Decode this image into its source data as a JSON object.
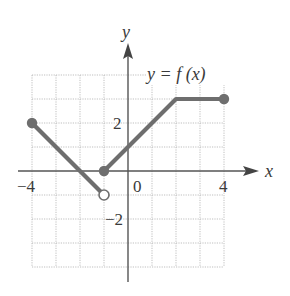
{
  "chart_data": {
    "type": "line",
    "title": "",
    "function_label": "y = f (x)",
    "xlabel": "x",
    "ylabel": "y",
    "xlim": [
      -4,
      4
    ],
    "ylim": [
      -4,
      4
    ],
    "grid": true,
    "x_ticks": [
      {
        "value": -4,
        "label": "−4"
      },
      {
        "value": 0,
        "label": "0"
      },
      {
        "value": 4,
        "label": "4"
      }
    ],
    "y_ticks": [
      {
        "value": 2,
        "label": "2"
      },
      {
        "value": -2,
        "label": "−2"
      }
    ],
    "series": [
      {
        "name": "segment-1",
        "points": [
          [
            -4,
            2
          ],
          [
            -1,
            -1
          ]
        ],
        "start": "closed",
        "end": "open"
      },
      {
        "name": "segment-2",
        "points": [
          [
            -1,
            0
          ],
          [
            2,
            3
          ],
          [
            4,
            3
          ]
        ],
        "start": "closed",
        "end": "closed"
      }
    ],
    "color": "#6e6e6e"
  },
  "layout": {
    "origin_px": [
      128,
      171
    ],
    "unit_px": 24
  }
}
